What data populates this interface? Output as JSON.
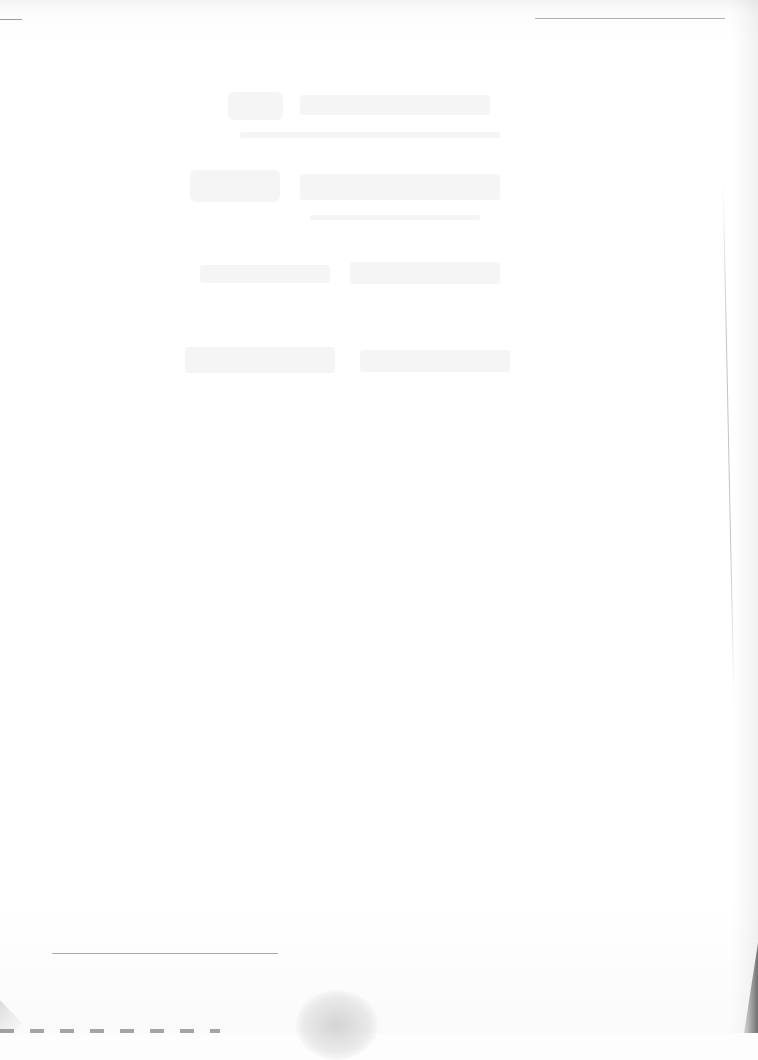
{
  "document": {
    "type": "scanned blank page",
    "content_note": "",
    "bleed_through": {
      "visible": true,
      "legible": false,
      "lines": [
        "",
        "",
        "",
        ""
      ]
    },
    "rules": [
      {
        "position": "top-left",
        "x": 0,
        "y": 19,
        "width": 22
      },
      {
        "position": "top-right",
        "x": 535,
        "y": 19,
        "width": 190
      },
      {
        "position": "footnote-separator",
        "x": 52,
        "y": 953,
        "width": 226
      }
    ],
    "colors": {
      "paper": "#ffffff",
      "rule": "#9a9a9a",
      "edge_shadow": "#5a5a5a"
    }
  }
}
